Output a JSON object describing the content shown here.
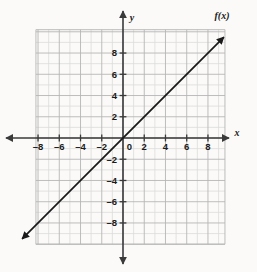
{
  "chart_data": {
    "type": "line",
    "title": "",
    "xlabel": "x",
    "ylabel": "y",
    "grid": true,
    "legend_position": "curve-end-top-right",
    "xlim": [
      -10,
      10
    ],
    "ylim": [
      -10,
      10
    ],
    "x_ticks": [
      -8,
      -6,
      -4,
      -2,
      0,
      2,
      4,
      6,
      8
    ],
    "y_ticks": [
      8,
      6,
      4,
      2,
      0,
      -2,
      -4,
      -6,
      -8
    ],
    "x_tick_labels": [
      "–8",
      "–6",
      "–4",
      "–2",
      "0",
      "2",
      "4",
      "6",
      "8"
    ],
    "y_tick_labels": [
      "8",
      "6",
      "4",
      "2",
      "0",
      "–2",
      "–4",
      "–6",
      "–8"
    ],
    "minor_tick_step": 1,
    "major_tick_step": 2,
    "series": [
      {
        "name": "f(x)",
        "label": "f(x)",
        "equation": "y = x",
        "slope": 1,
        "intercept": 0,
        "x": [
          -9.5,
          9.5
        ],
        "values": [
          -9.5,
          9.5
        ],
        "color": "#1a1a1a",
        "arrow_start": true,
        "arrow_end": true
      }
    ],
    "annotations": [
      {
        "text": "f(x)",
        "x": 10.2,
        "y": 10.6
      }
    ],
    "colors": {
      "background": "#fbfaf8",
      "grid_minor": "#d8d8d8",
      "grid_major": "#b9b9b9",
      "axis": "#3a3a3a",
      "line": "#1a1a1a",
      "text": "#1a1a1a"
    }
  },
  "axes": {
    "x_axis_name": "x",
    "y_axis_name": "y",
    "origin_label": "0"
  }
}
